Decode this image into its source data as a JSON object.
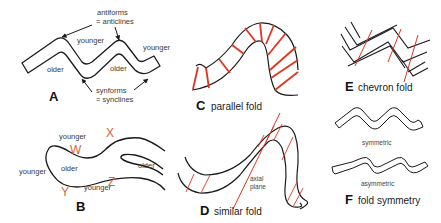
{
  "figure": {
    "colors": {
      "line": "#1a1a1a",
      "axial_red": "#e0341f",
      "label_red": "#e0603a",
      "text": "#3a3a3a",
      "background": "#ffffff"
    }
  },
  "panel_a": {
    "letter": "A",
    "antiform_label_1": "antiforms",
    "antiform_label_2": "= anticlines",
    "synform_label_1": "synforms",
    "synform_label_2": "= synclines",
    "younger_1": "younger",
    "younger_2": "younger",
    "older_1": "older",
    "older_2": "older"
  },
  "panel_b": {
    "letter": "B",
    "younger_top": "younger",
    "younger_left": "younger",
    "younger_bottom": "younger",
    "older_center": "older",
    "older_right": "older",
    "point_w": "W",
    "point_x": "X",
    "point_y": "Y",
    "point_z": "Z"
  },
  "panel_c": {
    "letter": "C",
    "caption": "parallel fold"
  },
  "panel_d": {
    "letter": "D",
    "caption": "similar fold",
    "axial_label_1": "axial",
    "axial_label_2": "plane"
  },
  "panel_e": {
    "letter": "E",
    "caption": "chevron fold"
  },
  "panel_f": {
    "letter": "F",
    "caption": "fold symmetry",
    "symmetric_label": "symmetric",
    "asymmetric_label": "asymmetric"
  }
}
